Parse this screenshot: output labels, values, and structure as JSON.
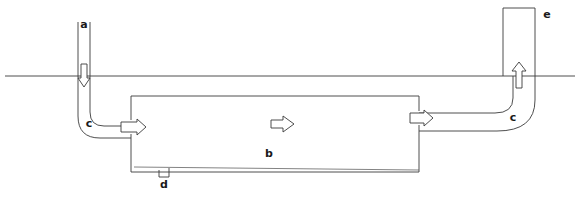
{
  "figure": {
    "background_color": "#ffffff",
    "line_color": "#3a3a3a",
    "width": 580,
    "height": 199
  },
  "labels": {
    "inlet_pipe": "a",
    "tank": "b",
    "elbow_left": "c",
    "elbow_right": "c",
    "drain": "d",
    "riser_pipe": "e"
  },
  "elements": {
    "ground_line": {
      "name": "ground-line",
      "y": 76,
      "x_start": 5,
      "x_end": 575
    },
    "inlet_pipe": {
      "name": "inlet-pipe-a",
      "label": "a",
      "orientation": "vertical",
      "top_y": 22,
      "x_left": 78,
      "x_right": 90,
      "flow_direction": "down"
    },
    "riser_pipe": {
      "name": "riser-pipe-e",
      "label": "e",
      "orientation": "vertical",
      "top_y": 8,
      "x_left": 503,
      "x_right": 535,
      "flow_direction": "up"
    },
    "tank": {
      "name": "tank-b",
      "label": "b",
      "x_left": 131,
      "x_right": 419,
      "y_top": 96,
      "y_bottom": 172,
      "flow_direction": "right"
    },
    "drain_notch": {
      "name": "drain-notch-d",
      "label": "d",
      "x": 164,
      "y": 172
    }
  },
  "arrows": [
    {
      "name": "inlet-flow-arrow",
      "direction": "down",
      "x": 84,
      "y": 76
    },
    {
      "name": "tank-inlet-arrow",
      "direction": "right",
      "x": 131,
      "y": 127
    },
    {
      "name": "tank-center-flow-arrow",
      "direction": "right",
      "x": 283,
      "y": 124
    },
    {
      "name": "tank-outlet-arrow",
      "direction": "right",
      "x": 419,
      "y": 118
    },
    {
      "name": "riser-flow-arrow",
      "direction": "up",
      "x": 519,
      "y": 76
    }
  ]
}
